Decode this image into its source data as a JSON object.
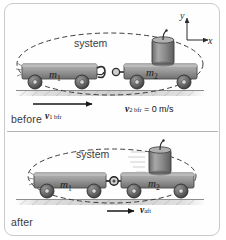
{
  "figure": {
    "background": "#ffffff",
    "frame_color": "#c9c9c9",
    "divider_color": "#b4b4b4"
  },
  "axes": {
    "x_label": "x",
    "y_label": "y",
    "color": "#2b2b2b",
    "origin_px": [
      187,
      40
    ]
  },
  "panels": [
    {
      "id": "before",
      "caption": "before",
      "system_label": "system",
      "objects": [
        {
          "name": "cart-1",
          "mass_label": "m",
          "mass_subscript": "1",
          "body_color": "#8e8e8e",
          "wheel_color": "#555555",
          "coupled": false
        },
        {
          "name": "cart-2",
          "mass_label": "m",
          "mass_subscript": "2",
          "body_color": "#9b9b9b",
          "wheel_color": "#555555",
          "coupled": false,
          "payload": "canister"
        }
      ],
      "velocities": [
        {
          "name": "v1-before",
          "symbol": "v",
          "subscript": "1 bfr",
          "value": "",
          "unit": "",
          "arrow": true,
          "direction": "right"
        },
        {
          "name": "v2-before",
          "symbol": "v",
          "subscript": "2 bfr",
          "equals": "=",
          "value": "0",
          "unit": "m/s",
          "arrow": false,
          "direction": "none"
        }
      ]
    },
    {
      "id": "after",
      "caption": "after",
      "system_label": "system",
      "objects": [
        {
          "name": "cart-1",
          "mass_label": "m",
          "mass_subscript": "1",
          "body_color": "#8e8e8e",
          "wheel_color": "#555555",
          "coupled": true
        },
        {
          "name": "cart-2",
          "mass_label": "m",
          "mass_subscript": "2",
          "body_color": "#9b9b9b",
          "wheel_color": "#555555",
          "coupled": true,
          "payload": "canister"
        }
      ],
      "velocities": [
        {
          "name": "v-after",
          "symbol": "v",
          "subscript": "aft",
          "value": "",
          "unit": "",
          "arrow": true,
          "direction": "right"
        }
      ]
    }
  ],
  "icons": {
    "arrow": "velocity-arrow-icon",
    "canister": "canister-icon",
    "coupler": "coupler-icon",
    "system_boundary": "dashed-ellipse-icon"
  }
}
